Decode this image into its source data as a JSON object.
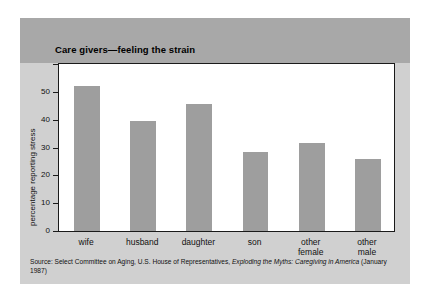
{
  "chart_data": {
    "type": "bar",
    "title": "Care givers—feeling the strain",
    "xlabel": "",
    "ylabel": "percentage reporting stress",
    "categories": [
      "wife",
      "husband",
      "daughter",
      "son",
      "other female",
      "other male"
    ],
    "category_lines": [
      [
        "wife"
      ],
      [
        "husband"
      ],
      [
        "daughter"
      ],
      [
        "son"
      ],
      [
        "other",
        "female"
      ],
      [
        "other",
        "male"
      ]
    ],
    "values": [
      52,
      39.5,
      45.5,
      28.5,
      31.5,
      26
    ],
    "ylim": [
      0,
      60
    ],
    "yticks": [
      0,
      10,
      20,
      30,
      40,
      50
    ],
    "ytick_labels": [
      "0",
      "10",
      "20",
      "30",
      "40",
      "50"
    ],
    "grid": false,
    "legend": "none",
    "bar_color": "#9e9e9e"
  },
  "source": {
    "prefix": "Source: Select Committee on Aging, U.S. House of Representatives, ",
    "italic_title": "Exploding the Myths: Caregiving in America",
    "suffix": " (January 1987)"
  },
  "colors": {
    "panel_background": "#d0d0d0",
    "header_band": "#a8a8a8",
    "plot_background": "#ffffff",
    "axis": "#1a1a1a",
    "bar": "#9e9e9e",
    "text": "#111111"
  }
}
